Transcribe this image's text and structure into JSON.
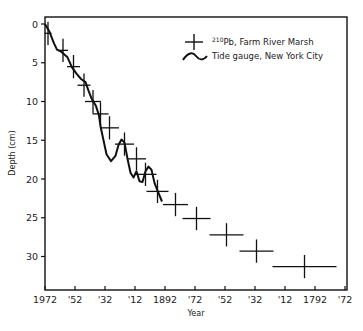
{
  "chart_data": {
    "type": "scatter",
    "title": "",
    "xlabel": "Year",
    "ylabel": "Depth (cm)",
    "x_tick_labels": [
      "1972",
      "'52",
      "'32",
      "'12",
      "1892",
      "'72",
      "'52",
      "'32",
      "'12",
      "1792",
      "'72"
    ],
    "x_tick_years": [
      1972,
      1952,
      1932,
      1912,
      1892,
      1872,
      1852,
      1832,
      1812,
      1792,
      1772
    ],
    "y_ticks": [
      0,
      5,
      10,
      15,
      20,
      25,
      30
    ],
    "xlim": [
      1972,
      1770
    ],
    "ylim": [
      0,
      33
    ],
    "y_inverted": true,
    "legend_position": "upper right",
    "series": [
      {
        "name": "210Pb, Farm River Marsh",
        "marker": "cross-errorbar",
        "points": [
          {
            "year": 1970,
            "depth": 1.2,
            "xerr": 1,
            "yerr": 1.5
          },
          {
            "year": 1960,
            "depth": 3.4,
            "xerr": 2,
            "yerr": 1.5
          },
          {
            "year": 1953,
            "depth": 5.5,
            "xerr": 3,
            "yerr": 1.5
          },
          {
            "year": 1946,
            "depth": 7.9,
            "xerr": 3,
            "yerr": 1.5
          },
          {
            "year": 1940,
            "depth": 10.0,
            "xerr": 4,
            "yerr": 1.5
          },
          {
            "year": 1935,
            "depth": 11.6,
            "xerr": 4,
            "yerr": 1.5
          },
          {
            "year": 1929,
            "depth": 13.4,
            "xerr": 5,
            "yerr": 1.5
          },
          {
            "year": 1919,
            "depth": 15.5,
            "xerr": 5,
            "yerr": 1.5
          },
          {
            "year": 1911,
            "depth": 17.4,
            "xerr": 5,
            "yerr": 1.5
          },
          {
            "year": 1905,
            "depth": 19.4,
            "xerr": 6,
            "yerr": 1.5
          },
          {
            "year": 1897,
            "depth": 21.6,
            "xerr": 6,
            "yerr": 1.5
          },
          {
            "year": 1885,
            "depth": 23.3,
            "xerr": 7,
            "yerr": 1.5
          },
          {
            "year": 1871,
            "depth": 25.1,
            "xerr": 8,
            "yerr": 1.5
          },
          {
            "year": 1851,
            "depth": 27.2,
            "xerr": 10,
            "yerr": 1.5
          },
          {
            "year": 1831,
            "depth": 29.3,
            "xerr": 10,
            "yerr": 1.5
          },
          {
            "year": 1799,
            "depth": 31.3,
            "xerr": 20,
            "yerr": 1.5
          }
        ]
      },
      {
        "name": "Tide gauge, New York City",
        "marker": "line",
        "points": [
          {
            "year": 1972,
            "depth": 0.0
          },
          {
            "year": 1969,
            "depth": 1.0
          },
          {
            "year": 1966,
            "depth": 2.5
          },
          {
            "year": 1964,
            "depth": 3.3
          },
          {
            "year": 1961,
            "depth": 3.6
          },
          {
            "year": 1957,
            "depth": 4.3
          },
          {
            "year": 1954,
            "depth": 5.6
          },
          {
            "year": 1951,
            "depth": 6.4
          },
          {
            "year": 1948,
            "depth": 7.1
          },
          {
            "year": 1945,
            "depth": 7.5
          },
          {
            "year": 1943,
            "depth": 8.6
          },
          {
            "year": 1941,
            "depth": 9.6
          },
          {
            "year": 1938,
            "depth": 10.6
          },
          {
            "year": 1936,
            "depth": 11.8
          },
          {
            "year": 1935,
            "depth": 13.2
          },
          {
            "year": 1933,
            "depth": 15.0
          },
          {
            "year": 1931,
            "depth": 16.8
          },
          {
            "year": 1928,
            "depth": 17.7
          },
          {
            "year": 1925,
            "depth": 17.0
          },
          {
            "year": 1923,
            "depth": 15.6
          },
          {
            "year": 1921,
            "depth": 14.9
          },
          {
            "year": 1919,
            "depth": 15.3
          },
          {
            "year": 1917,
            "depth": 17.4
          },
          {
            "year": 1915,
            "depth": 19.2
          },
          {
            "year": 1913,
            "depth": 19.8
          },
          {
            "year": 1911,
            "depth": 19.0
          },
          {
            "year": 1909,
            "depth": 20.3
          },
          {
            "year": 1907,
            "depth": 20.4
          },
          {
            "year": 1905,
            "depth": 19.0
          },
          {
            "year": 1903,
            "depth": 18.4
          },
          {
            "year": 1901,
            "depth": 18.8
          },
          {
            "year": 1899,
            "depth": 20.5
          },
          {
            "year": 1897,
            "depth": 21.5
          },
          {
            "year": 1894,
            "depth": 22.9
          }
        ]
      }
    ]
  },
  "legend": {
    "items": [
      {
        "label_sup": "210",
        "label": "Pb, Farm River Marsh"
      },
      {
        "label": "Tide gauge, New York City"
      }
    ]
  },
  "axes": {
    "x_title": "Year",
    "y_title": "Depth (cm)"
  }
}
